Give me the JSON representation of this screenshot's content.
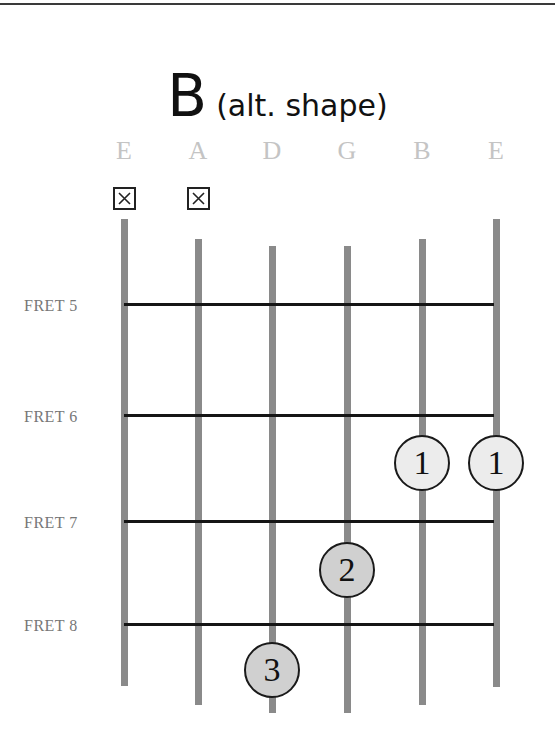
{
  "title": {
    "chord": "B",
    "subtitle": "(alt. shape)"
  },
  "strings": [
    {
      "name": "E",
      "x": 124,
      "top": 219,
      "bottom": 686,
      "muted": true
    },
    {
      "name": "A",
      "x": 198,
      "top": 239,
      "bottom": 705,
      "muted": true
    },
    {
      "name": "D",
      "x": 272,
      "top": 246,
      "bottom": 713,
      "muted": false
    },
    {
      "name": "G",
      "x": 347,
      "top": 246,
      "bottom": 713,
      "muted": false
    },
    {
      "name": "B",
      "x": 422,
      "top": 239,
      "bottom": 705,
      "muted": false
    },
    {
      "name": "E",
      "x": 496,
      "top": 219,
      "bottom": 687,
      "muted": false
    }
  ],
  "mute_symbol": "X",
  "frets": [
    {
      "label": "FRET 5",
      "y": 304
    },
    {
      "label": "FRET 6",
      "y": 415
    },
    {
      "label": "FRET 7",
      "y": 521
    },
    {
      "label": "FRET 8",
      "y": 624
    }
  ],
  "fingers": [
    {
      "finger": "1",
      "string": "B",
      "fret": 6,
      "x": 422,
      "y": 463,
      "fill": "#ececec"
    },
    {
      "finger": "1",
      "string": "E",
      "fret": 6,
      "x": 496,
      "y": 463,
      "fill": "#ececec"
    },
    {
      "finger": "2",
      "string": "G",
      "fret": 7,
      "x": 347,
      "y": 570,
      "fill": "#d0d0d0"
    },
    {
      "finger": "3",
      "string": "D",
      "fret": 8,
      "x": 272,
      "y": 670,
      "fill": "#d0d0d0"
    }
  ],
  "colors": {
    "string": "#8a8a8a",
    "fret_line": "#151515",
    "string_label": "#c4c4c4",
    "fret_label": "#777777"
  }
}
